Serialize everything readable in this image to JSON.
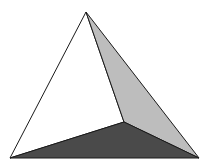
{
  "diagram": {
    "type": "tetrahedron",
    "width": 208,
    "height": 168,
    "background": "#ffffff",
    "vertices": {
      "apex": [
        86,
        12
      ],
      "bottom_left": [
        10,
        158
      ],
      "bottom_right": [
        199,
        158
      ],
      "inner": [
        124,
        122
      ]
    },
    "faces": [
      {
        "name": "left-face",
        "points": "86,12 10,158 124,122",
        "fill": "#ffffff"
      },
      {
        "name": "right-face",
        "points": "86,12 124,122 199,158",
        "fill": "#bdbdbd"
      },
      {
        "name": "bottom-face",
        "points": "10,158 124,122 199,158",
        "fill": "#4a4a4a"
      }
    ],
    "edge_color": "#1a1a1a",
    "edge_width": 1
  }
}
